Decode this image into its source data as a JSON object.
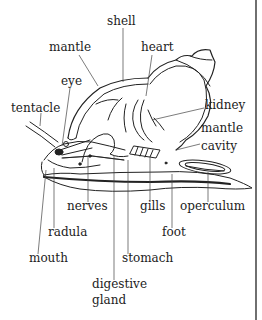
{
  "diagram": {
    "colors": {
      "ink": "#222222",
      "background": "#ffffff"
    },
    "labels": {
      "shell": "shell",
      "mantle": "mantle",
      "heart": "heart",
      "eye": "eye",
      "tentacle": "tentacle",
      "kidney": "kidney",
      "mantle_cavity_line1": "mantle",
      "mantle_cavity_line2": "cavity",
      "nerves": "nerves",
      "gills": "gills",
      "operculum": "operculum",
      "radula": "radula",
      "foot": "foot",
      "mouth": "mouth",
      "stomach": "stomach",
      "digestive_gland_line1": "digestive",
      "digestive_gland_line2": "gland"
    }
  }
}
